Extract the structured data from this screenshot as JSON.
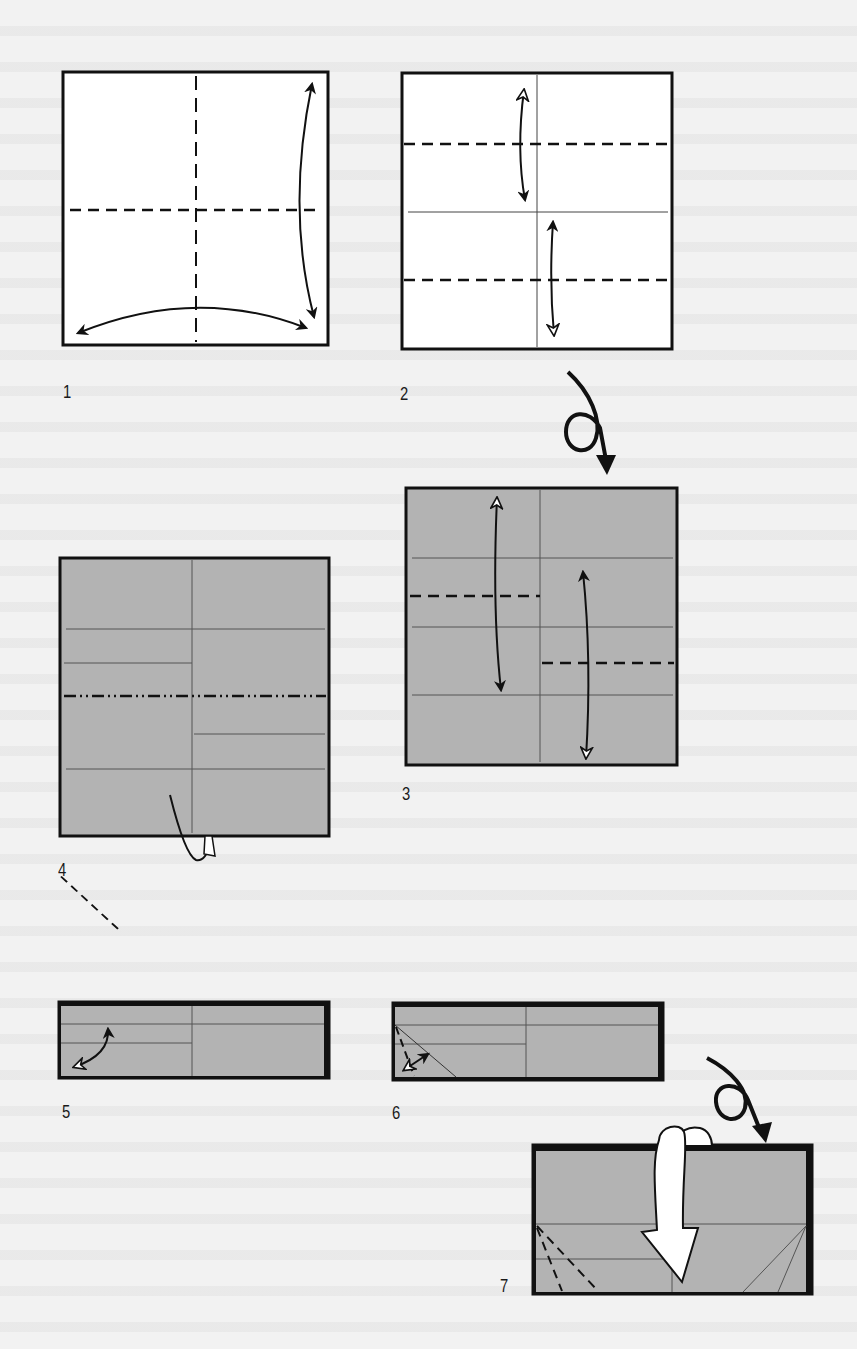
{
  "document": {
    "type": "origami instruction diagram",
    "background_text": "faint unreadable bleed-through text from reverse page"
  },
  "colors": {
    "paper_white": "#ffffff",
    "paper_colored": "#b3b3b3",
    "line": "#111111",
    "crease": "#555555",
    "background": "#f2f2f2"
  },
  "steps": [
    {
      "number": "1",
      "label": "1",
      "paper": "white-side",
      "marks": [
        "vertical valley fold line",
        "horizontal valley fold line",
        "fold-and-unfold arrow right edge",
        "fold-and-unfold arrow bottom edge"
      ]
    },
    {
      "number": "2",
      "label": "2",
      "paper": "white-side",
      "marks": [
        "two horizontal valley fold lines",
        "two fold-and-unfold arrows",
        "vertical crease",
        "horizontal crease"
      ]
    },
    {
      "number": "3",
      "label": "3",
      "paper": "colored-side",
      "marks": [
        "short valley fold left",
        "short valley fold right",
        "fold-and-unfold arrows",
        "creases"
      ]
    },
    {
      "number": "4",
      "label": "4",
      "paper": "colored-side",
      "marks": [
        "horizontal mountain fold line",
        "fold behind arrow",
        "creases"
      ]
    },
    {
      "number": "5",
      "label": "5",
      "paper": "colored-side",
      "marks": [
        "diagonal valley fold corner",
        "fold-and-unfold arrow"
      ]
    },
    {
      "number": "6",
      "label": "6",
      "paper": "colored-side",
      "marks": [
        "diagonal valley fold corner",
        "fold-and-unfold arrow",
        "diagonal crease"
      ]
    },
    {
      "number": "7",
      "label": "7",
      "paper": "colored-side",
      "marks": [
        "two diagonal valley folds",
        "open-sink arrow",
        "diagonal creases right"
      ]
    }
  ],
  "turn_over_symbols": [
    {
      "between": "2-3",
      "name": "turn-over"
    },
    {
      "between": "6-7",
      "name": "turn-over"
    }
  ]
}
